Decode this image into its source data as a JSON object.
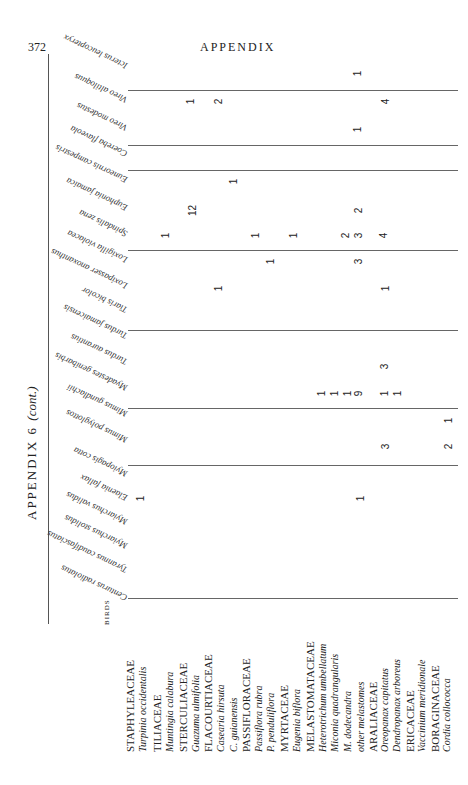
{
  "page": {
    "number": "372",
    "running_header": "APPENDIX",
    "table_title": "APPENDIX 6",
    "table_title_suffix": "(cont.)",
    "birds_caption": "BIRDS"
  },
  "birds": [
    {
      "name": "Icterus leucopteryx",
      "y": 62
    },
    {
      "name": "Vireo altiloquus",
      "y": 96
    },
    {
      "name": "Vireo modestus",
      "y": 124
    },
    {
      "name": "Coereba flaveola",
      "y": 150
    },
    {
      "name": "Euneornis campestris",
      "y": 176
    },
    {
      "name": "Euphonia jamaica",
      "y": 204
    },
    {
      "name": "Spindalis zena",
      "y": 230
    },
    {
      "name": "Loxigilla violacea",
      "y": 256
    },
    {
      "name": "Loxipasser anoxanthus",
      "y": 282
    },
    {
      "name": "Tiaris bicolor",
      "y": 306
    },
    {
      "name": "Turdus jamaicensis",
      "y": 332
    },
    {
      "name": "Turdus aurantius",
      "y": 358
    },
    {
      "name": "Myadestes genibarbis",
      "y": 384
    },
    {
      "name": "Mimus gundlachii",
      "y": 410
    },
    {
      "name": "Mimus polyglottos",
      "y": 436
    },
    {
      "name": "Myiopagis cotta",
      "y": 470
    },
    {
      "name": "Elaenia fallax",
      "y": 494
    },
    {
      "name": "Myiarchus validus",
      "y": 518
    },
    {
      "name": "Myiarchus stolidus",
      "y": 542
    },
    {
      "name": "Tyrannus caudifasciatus",
      "y": 566
    },
    {
      "name": "Centurus radiolatus",
      "y": 594
    }
  ],
  "group_lines_y": [
    90,
    145,
    170,
    250,
    330,
    408,
    465,
    598
  ],
  "plants": [
    {
      "name": "STAPHYLEACEAE",
      "family": true,
      "x": 130
    },
    {
      "name": "Turpinia occidentalis",
      "family": false,
      "x": 143
    },
    {
      "name": "TILIACEAE",
      "family": true,
      "x": 157
    },
    {
      "name": "Muntingia calabura",
      "family": false,
      "x": 170
    },
    {
      "name": "STERCULIACEAE",
      "family": true,
      "x": 183
    },
    {
      "name": "Guazuma ulmifolia",
      "family": false,
      "x": 196
    },
    {
      "name": "FLACOURTIACEAE",
      "family": true,
      "x": 208
    },
    {
      "name": "Casearia hirsuta",
      "family": false,
      "x": 221
    },
    {
      "name": "C. guianensis",
      "family": false,
      "x": 234
    },
    {
      "name": "PASSIFLORACEAE",
      "family": true,
      "x": 246
    },
    {
      "name": "Passiflora rubra",
      "family": false,
      "x": 259
    },
    {
      "name": "P. penduliflora",
      "family": false,
      "x": 271
    },
    {
      "name": "MYRTACEAE",
      "family": true,
      "x": 284
    },
    {
      "name": "Eugenia biflora",
      "family": false,
      "x": 297
    },
    {
      "name": "MELASTOMATACEAE",
      "family": true,
      "x": 310
    },
    {
      "name": "Heterotrichum umbellatum",
      "family": false,
      "x": 323
    },
    {
      "name": "Miconia quadrangularis",
      "family": false,
      "x": 335
    },
    {
      "name": "M. dodecandra",
      "family": false,
      "x": 348
    },
    {
      "name": "other melastomes",
      "family": false,
      "x": 361
    },
    {
      "name": "ARALIACEAE",
      "family": true,
      "x": 373
    },
    {
      "name": "Oreopanax capitatus",
      "family": false,
      "x": 385
    },
    {
      "name": "Dendropanax arboreus",
      "family": false,
      "x": 397
    },
    {
      "name": "ERICACEAE",
      "family": true,
      "x": 410
    },
    {
      "name": "Vaccinium meridionale",
      "family": false,
      "x": 422
    },
    {
      "name": "BORAGINACEAE",
      "family": true,
      "x": 435
    },
    {
      "name": "Cordia collococca",
      "family": false,
      "x": 447
    }
  ],
  "cells": [
    {
      "bird": "Icterus leucopteryx",
      "plant": "other melastomes",
      "value": "1",
      "x": 357,
      "y": 75
    },
    {
      "bird": "Vireo altiloquus",
      "plant": "Guazuma ulmifolia",
      "value": "1",
      "x": 190,
      "y": 103
    },
    {
      "bird": "Vireo altiloquus",
      "plant": "Casearia hirsuta",
      "value": "2",
      "x": 218,
      "y": 103
    },
    {
      "bird": "Vireo altiloquus",
      "plant": "Oreopanax capitatus",
      "value": "4",
      "x": 385,
      "y": 103
    },
    {
      "bird": "Vireo modestus",
      "plant": "other melastomes",
      "value": "1",
      "x": 357,
      "y": 131
    },
    {
      "bird": "Euneornis campestris",
      "plant": "C. guianensis",
      "value": "1",
      "x": 233,
      "y": 183
    },
    {
      "bird": "Euphonia jamaica",
      "plant": "Guazuma ulmifolia",
      "value": "12",
      "x": 192,
      "y": 212
    },
    {
      "bird": "Euphonia jamaica",
      "plant": "other melastomes",
      "value": "2",
      "x": 358,
      "y": 212
    },
    {
      "bird": "Spindalis zena",
      "plant": "Muntingia calabura",
      "value": "1",
      "x": 165,
      "y": 237
    },
    {
      "bird": "Spindalis zena",
      "plant": "Passiflora rubra",
      "value": "1",
      "x": 255,
      "y": 237
    },
    {
      "bird": "Spindalis zena",
      "plant": "Eugenia biflora",
      "value": "1",
      "x": 293,
      "y": 237
    },
    {
      "bird": "Spindalis zena",
      "plant": "M. dodecandra",
      "value": "2",
      "x": 345,
      "y": 237
    },
    {
      "bird": "Spindalis zena",
      "plant": "other melastomes",
      "value": "3",
      "x": 358,
      "y": 237
    },
    {
      "bird": "Spindalis zena",
      "plant": "Oreopanax capitatus",
      "value": "4",
      "x": 383,
      "y": 237
    },
    {
      "bird": "Loxigilla violacea",
      "plant": "P. penduliflora",
      "value": "1",
      "x": 270,
      "y": 263
    },
    {
      "bird": "Loxigilla violacea",
      "plant": "other melastomes",
      "value": "3",
      "x": 358,
      "y": 263
    },
    {
      "bird": "Loxipasser anoxanthus",
      "plant": "Casearia hirsuta",
      "value": "1",
      "x": 218,
      "y": 290
    },
    {
      "bird": "Loxipasser anoxanthus",
      "plant": "Oreopanax capitatus",
      "value": "1",
      "x": 385,
      "y": 290
    },
    {
      "bird": "Myadestes genibarbis",
      "plant": "Oreopanax capitatus",
      "value": "3",
      "x": 384,
      "y": 368
    },
    {
      "bird": "Mimus gundlachii",
      "plant": "Heterotrichum umbellatum",
      "value": "1",
      "x": 321,
      "y": 395
    },
    {
      "bird": "Mimus gundlachii",
      "plant": "Miconia quadrangularis",
      "value": "1",
      "x": 334,
      "y": 395
    },
    {
      "bird": "Mimus gundlachii",
      "plant": "M. dodecandra",
      "value": "1",
      "x": 347,
      "y": 395
    },
    {
      "bird": "Mimus gundlachii",
      "plant": "other melastomes",
      "value": "9",
      "x": 358,
      "y": 395
    },
    {
      "bird": "Mimus gundlachii",
      "plant": "Oreopanax capitatus",
      "value": "1",
      "x": 384,
      "y": 395
    },
    {
      "bird": "Mimus gundlachii",
      "plant": "Dendropanax arboreus",
      "value": "1",
      "x": 397,
      "y": 395
    },
    {
      "bird": "Mimus polyglottos",
      "plant": "Cordia collococca",
      "value": "1",
      "x": 448,
      "y": 422
    },
    {
      "bird": "Mimus polyglottos",
      "plant": "Oreopanax capitatus",
      "value": "3",
      "x": 385,
      "y": 448
    },
    {
      "bird": "Mimus polyglottos",
      "plant": "Cordia collococca",
      "value": "2",
      "x": 448,
      "y": 448
    },
    {
      "bird": "Elaenia fallax",
      "plant": "Turpinia occidentalis",
      "value": "1",
      "x": 140,
      "y": 500
    },
    {
      "bird": "Elaenia fallax",
      "plant": "other melastomes",
      "value": "1",
      "x": 360,
      "y": 500
    }
  ]
}
